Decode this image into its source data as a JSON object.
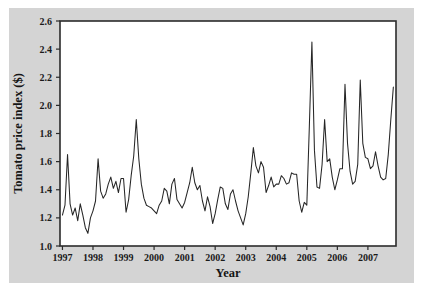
{
  "figure": {
    "background_color": "#ffffff",
    "panel_color": "#d4d4d4",
    "plot_area_color": "#ffffff",
    "line_color": "#262626",
    "axis_color": "#2b2b2b"
  },
  "chart_data": {
    "type": "line",
    "title": "",
    "xlabel": "Year",
    "ylabel": "Tomato price index ($)",
    "xlim": [
      1996.92,
      2007.92
    ],
    "ylim": [
      1.0,
      2.6
    ],
    "grid": false,
    "legend": null,
    "xticks": [
      1997,
      1998,
      1999,
      2000,
      2001,
      2002,
      2003,
      2004,
      2005,
      2006,
      2007
    ],
    "xticklabels": [
      "1997",
      "1998",
      "1999",
      "2000",
      "2001",
      "2002",
      "2003",
      "2004",
      "2005",
      "2006",
      "2007"
    ],
    "yticks": [
      1.0,
      1.2,
      1.4,
      1.6,
      1.8,
      2.0,
      2.2,
      2.4,
      2.6
    ],
    "yticklabels": [
      "1.0",
      "1.2",
      "1.4",
      "1.6",
      "1.8",
      "2.0",
      "2.2",
      "2.4",
      "2.6"
    ],
    "series": [
      {
        "name": "Tomato price index",
        "x": [
          1997.0,
          1997.083,
          1997.167,
          1997.25,
          1997.333,
          1997.417,
          1997.5,
          1997.583,
          1997.667,
          1997.75,
          1997.833,
          1997.917,
          1998.0,
          1998.083,
          1998.167,
          1998.25,
          1998.333,
          1998.417,
          1998.5,
          1998.583,
          1998.667,
          1998.75,
          1998.833,
          1998.917,
          1999.0,
          1999.083,
          1999.167,
          1999.25,
          1999.333,
          1999.417,
          1999.5,
          1999.583,
          1999.667,
          1999.75,
          1999.833,
          1999.917,
          2000.0,
          2000.083,
          2000.167,
          2000.25,
          2000.333,
          2000.417,
          2000.5,
          2000.583,
          2000.667,
          2000.75,
          2000.833,
          2000.917,
          2001.0,
          2001.083,
          2001.167,
          2001.25,
          2001.333,
          2001.417,
          2001.5,
          2001.583,
          2001.667,
          2001.75,
          2001.833,
          2001.917,
          2002.0,
          2002.083,
          2002.167,
          2002.25,
          2002.333,
          2002.417,
          2002.5,
          2002.583,
          2002.667,
          2002.75,
          2002.833,
          2002.917,
          2003.0,
          2003.083,
          2003.167,
          2003.25,
          2003.333,
          2003.417,
          2003.5,
          2003.583,
          2003.667,
          2003.75,
          2003.833,
          2003.917,
          2004.0,
          2004.083,
          2004.167,
          2004.25,
          2004.333,
          2004.417,
          2004.5,
          2004.583,
          2004.667,
          2004.75,
          2004.833,
          2004.917,
          2005.0,
          2005.083,
          2005.167,
          2005.25,
          2005.333,
          2005.417,
          2005.5,
          2005.583,
          2005.667,
          2005.75,
          2005.833,
          2005.917,
          2006.0,
          2006.083,
          2006.167,
          2006.25,
          2006.333,
          2006.417,
          2006.5,
          2006.583,
          2006.667,
          2006.75,
          2006.833,
          2006.917,
          2007.0,
          2007.083,
          2007.167,
          2007.25,
          2007.333,
          2007.417,
          2007.5,
          2007.583,
          2007.667,
          2007.75,
          2007.833
        ],
        "values": [
          1.22,
          1.29,
          1.65,
          1.3,
          1.22,
          1.27,
          1.18,
          1.3,
          1.22,
          1.13,
          1.09,
          1.2,
          1.25,
          1.32,
          1.62,
          1.39,
          1.34,
          1.37,
          1.44,
          1.49,
          1.41,
          1.46,
          1.38,
          1.48,
          1.48,
          1.24,
          1.33,
          1.5,
          1.64,
          1.9,
          1.62,
          1.44,
          1.34,
          1.29,
          1.28,
          1.27,
          1.25,
          1.23,
          1.29,
          1.32,
          1.41,
          1.39,
          1.3,
          1.44,
          1.48,
          1.33,
          1.3,
          1.27,
          1.31,
          1.38,
          1.45,
          1.56,
          1.45,
          1.4,
          1.43,
          1.32,
          1.25,
          1.35,
          1.28,
          1.16,
          1.23,
          1.33,
          1.42,
          1.41,
          1.3,
          1.26,
          1.37,
          1.4,
          1.32,
          1.25,
          1.2,
          1.15,
          1.23,
          1.35,
          1.52,
          1.7,
          1.57,
          1.52,
          1.6,
          1.56,
          1.38,
          1.43,
          1.49,
          1.42,
          1.44,
          1.44,
          1.5,
          1.48,
          1.44,
          1.45,
          1.52,
          1.51,
          1.51,
          1.32,
          1.24,
          1.31,
          1.29,
          1.85,
          2.45,
          1.68,
          1.42,
          1.41,
          1.58,
          1.9,
          1.6,
          1.62,
          1.49,
          1.4,
          1.47,
          1.55,
          1.55,
          2.15,
          1.73,
          1.53,
          1.44,
          1.46,
          1.58,
          2.18,
          1.73,
          1.63,
          1.62,
          1.55,
          1.57,
          1.67,
          1.57,
          1.49,
          1.47,
          1.48,
          1.65,
          1.9,
          2.13
        ]
      }
    ]
  }
}
